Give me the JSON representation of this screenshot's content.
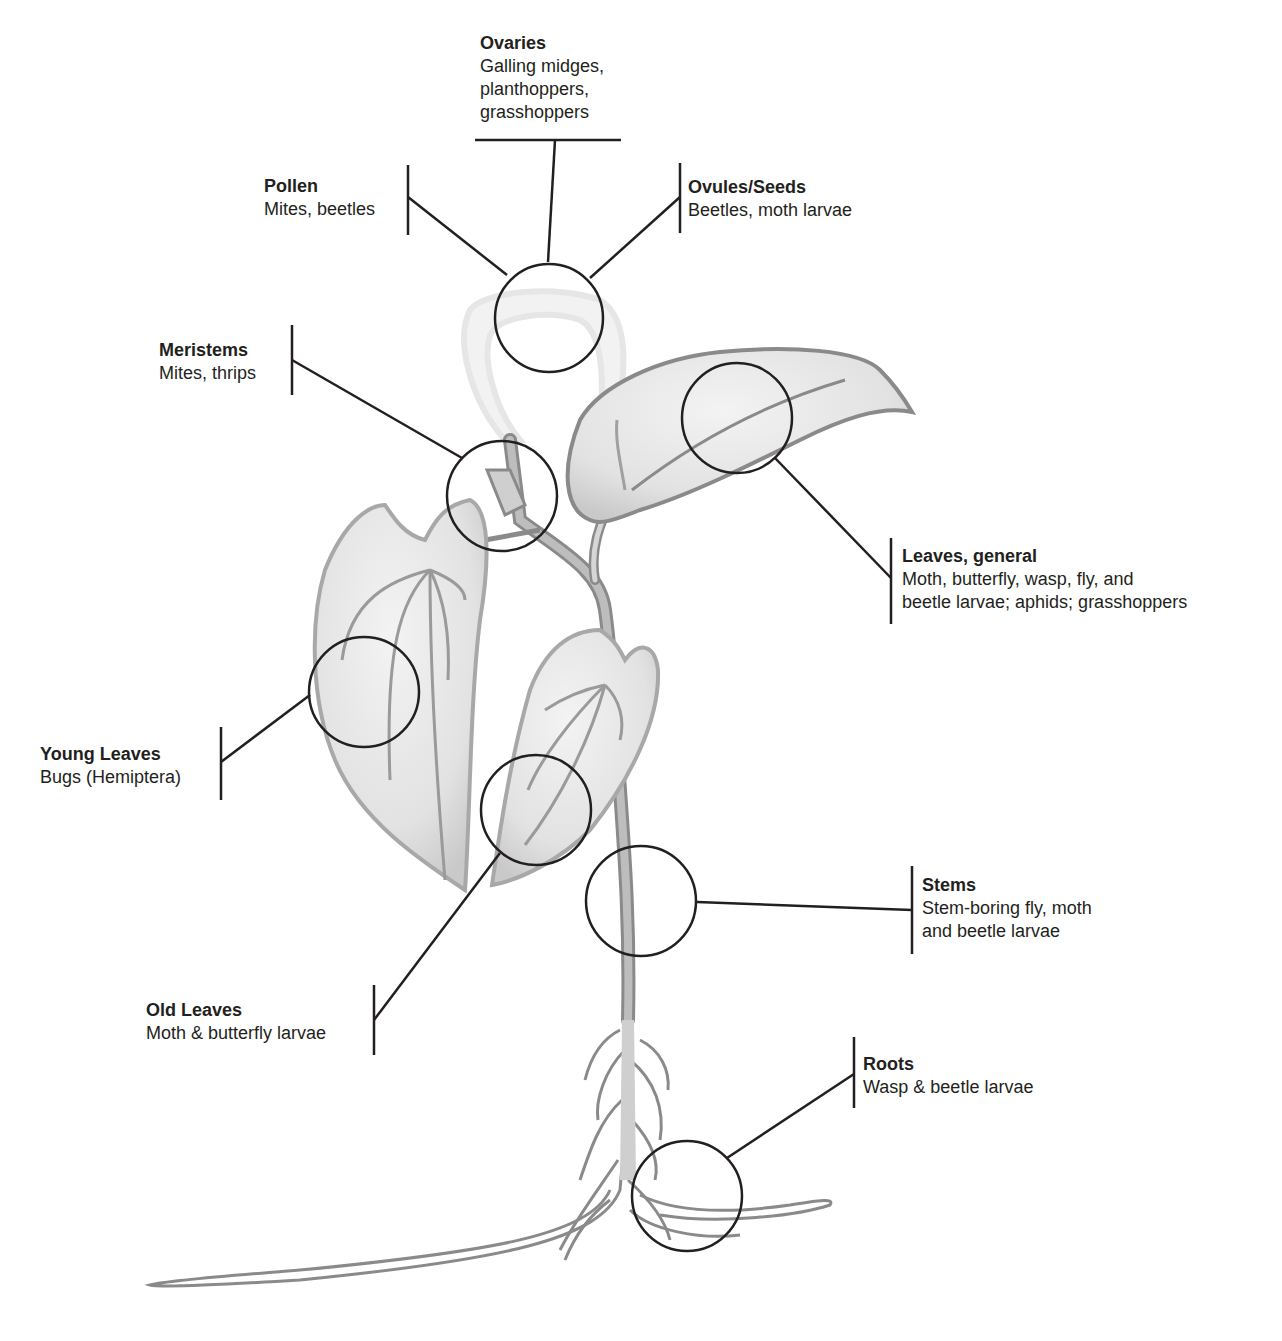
{
  "labels": {
    "ovaries": {
      "title": "Ovaries",
      "lines": [
        "Galling midges,",
        "planthoppers,",
        "grasshoppers"
      ]
    },
    "pollen": {
      "title": "Pollen",
      "lines": [
        "Mites, beetles"
      ]
    },
    "ovules": {
      "title": "Ovules/Seeds",
      "lines": [
        "Beetles, moth larvae"
      ]
    },
    "meristems": {
      "title": "Meristems",
      "lines": [
        "Mites, thrips"
      ]
    },
    "leaves_general": {
      "title": "Leaves, general",
      "lines": [
        "Moth, butterfly, wasp, fly, and",
        "beetle larvae; aphids; grasshoppers"
      ]
    },
    "young_leaves": {
      "title": "Young Leaves",
      "lines": [
        "Bugs (Hemiptera)"
      ]
    },
    "stems": {
      "title": "Stems",
      "lines": [
        "Stem-boring fly, moth",
        "and beetle larvae"
      ]
    },
    "old_leaves": {
      "title": "Old Leaves",
      "lines": [
        "Moth & butterfly larvae"
      ]
    },
    "roots": {
      "title": "Roots",
      "lines": [
        "Wasp & beetle larvae"
      ]
    }
  },
  "colors": {
    "line": "#231f20",
    "plant_fill": "#e4e4e4",
    "plant_stroke": "#8a8a8a",
    "flower_fill": "#f2f2f2"
  }
}
